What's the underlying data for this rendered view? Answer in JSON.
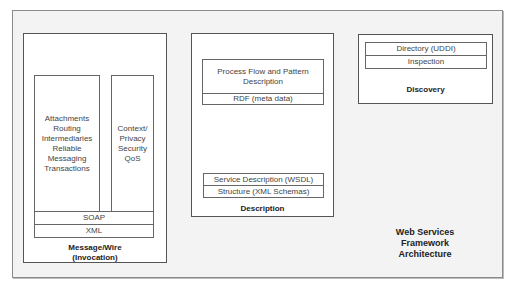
{
  "diagram": {
    "title_lines": [
      "Web Services",
      "Framework",
      "Architecture"
    ],
    "message_wire": {
      "label_lines": [
        "Message/Wire",
        "(Invocation)"
      ],
      "left_column": [
        "Attachments",
        "Routing",
        "Intermediaries",
        "Reliable",
        "Messaging",
        "Transactions"
      ],
      "right_column": [
        "Context/",
        "Privacy",
        "Security",
        "QoS"
      ],
      "layers": [
        "SOAP",
        "XML"
      ]
    },
    "description": {
      "label": "Description",
      "top_box": "Process Flow and Pattern Description",
      "rdf": "RDF (meta data)",
      "wsdl": "Service Description (WSDL)",
      "schemas": "Structure (XML Schemas)"
    },
    "discovery": {
      "label": "Discovery",
      "rows": [
        "Directory (UDDI)",
        "Inspection"
      ]
    }
  }
}
